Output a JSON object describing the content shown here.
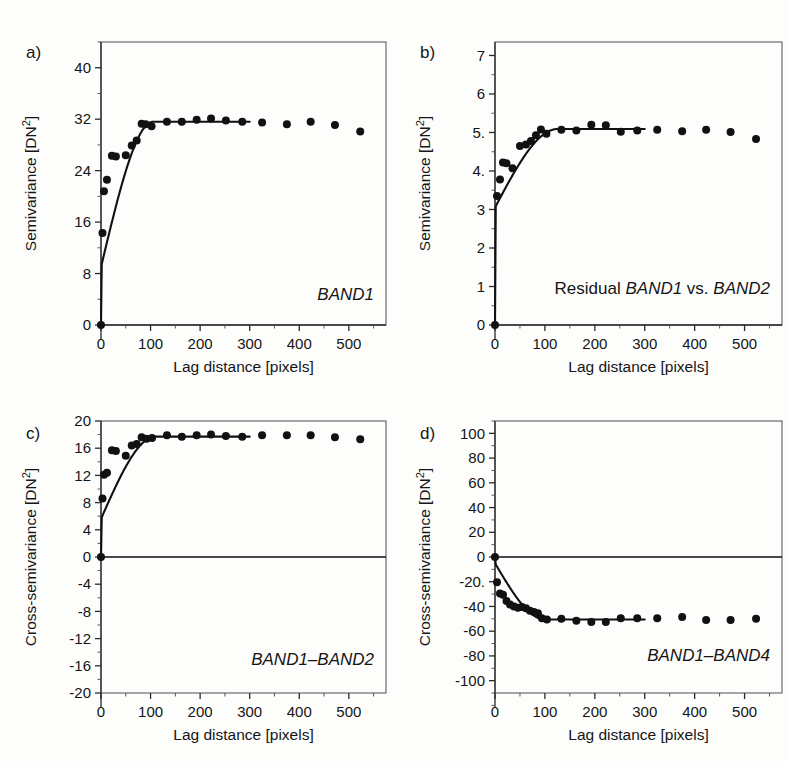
{
  "figure": {
    "background": "#fdfdfc",
    "point_color": "#111111",
    "curve_color": "#111111",
    "axis_color": "#2a2a2a"
  },
  "panels": [
    {
      "letter": "a)",
      "series_label": "BAND1",
      "series_label_prefix": "",
      "series_label_italic": true
    },
    {
      "letter": "b)",
      "series_label": "BAND1",
      "series_label_prefix": "Residual ",
      "series_label_mid": " vs. ",
      "series_label_suffix": "BAND2",
      "series_label_italic": true
    },
    {
      "letter": "c)",
      "series_label": "BAND1–BAND2",
      "series_label_italic": true
    },
    {
      "letter": "d)",
      "series_label": "BAND1–BAND4",
      "series_label_italic": true
    }
  ],
  "chart_data": [
    {
      "panel": "a",
      "type": "scatter",
      "title": "BAND1",
      "xlabel": "Lag distance [pixels]",
      "ylabel": "Semivariance [DN2]",
      "ylabel_display": "Semivariance [DN²]",
      "xlim": [
        0,
        575
      ],
      "ylim": [
        0,
        44
      ],
      "xticks": [
        0,
        100,
        200,
        300,
        400,
        500
      ],
      "xticklabels": [
        "0",
        "100",
        "200",
        "300",
        "400",
        "500"
      ],
      "xminor_step": 50,
      "yticks": [
        0,
        8,
        16,
        24,
        32,
        40
      ],
      "yticklabels": [
        "0",
        "8",
        "16",
        "24",
        "32",
        "40"
      ],
      "yminor_step": 4,
      "grid": false,
      "legend": "none",
      "zero_line": false,
      "x": [
        0,
        3,
        6,
        12,
        22,
        30,
        50,
        62,
        72,
        82,
        90,
        102,
        133,
        163,
        193,
        222,
        252,
        285,
        325,
        375,
        423,
        472,
        523
      ],
      "y": [
        0.0,
        14.3,
        20.8,
        22.6,
        26.3,
        26.2,
        26.4,
        27.9,
        28.7,
        31.3,
        31.2,
        30.9,
        31.6,
        31.6,
        31.9,
        32.1,
        31.8,
        31.6,
        31.5,
        31.2,
        31.6,
        31.1,
        30.1
      ],
      "model": {
        "type": "spherical",
        "nugget": 9.0,
        "sill": 31.6,
        "range": 105
      }
    },
    {
      "panel": "b",
      "type": "scatter",
      "title": "Residual BAND1 vs. BAND2",
      "xlabel": "Lag distance [pixels]",
      "ylabel": "Semivariance [DN2]",
      "ylabel_display": "Semivariance [DN²]",
      "xlim": [
        0,
        575
      ],
      "ylim": [
        0,
        7.35
      ],
      "xticks": [
        0,
        100,
        200,
        300,
        400,
        500
      ],
      "xticklabels": [
        "0",
        "100",
        "200",
        "300",
        "400",
        "500"
      ],
      "xminor_step": 50,
      "yticks": [
        0,
        1,
        2,
        3,
        4,
        5,
        6,
        7
      ],
      "yticklabels": [
        "0",
        "1",
        "2",
        "3",
        "4.",
        "5.",
        "6",
        "7"
      ],
      "yminor_step": 0.5,
      "grid": false,
      "legend": "none",
      "zero_line": false,
      "x": [
        0,
        4,
        10,
        16,
        23,
        35,
        50,
        62,
        72,
        82,
        92,
        103,
        133,
        163,
        193,
        222,
        252,
        285,
        325,
        375,
        423,
        472,
        523
      ],
      "y": [
        0.0,
        3.35,
        3.78,
        4.22,
        4.2,
        4.07,
        4.65,
        4.69,
        4.78,
        4.93,
        5.08,
        4.97,
        5.07,
        5.05,
        5.2,
        5.19,
        5.02,
        5.05,
        5.07,
        5.03,
        5.07,
        5.01,
        4.83
      ],
      "model": {
        "type": "spherical",
        "nugget": 3.05,
        "sill": 5.09,
        "range": 125
      }
    },
    {
      "panel": "c",
      "type": "scatter",
      "title": "BAND1–BAND2",
      "xlabel": "Lag distance [pixels]",
      "ylabel": "Cross-semivariance [DN2]",
      "ylabel_display": "Cross-semivariance [DN²]",
      "xlim": [
        0,
        575
      ],
      "ylim": [
        -20,
        20
      ],
      "xticks": [
        0,
        100,
        200,
        300,
        400,
        500
      ],
      "xticklabels": [
        "0",
        "100",
        "200",
        "300",
        "400",
        "500"
      ],
      "xminor_step": 50,
      "yticks": [
        -20,
        -16,
        -12,
        -8,
        -4,
        0,
        4,
        8,
        12,
        16,
        20
      ],
      "yticklabels": [
        "-20",
        "-16",
        "-12",
        "-8",
        "-4",
        "0",
        "4",
        "8",
        "12",
        "16",
        "20"
      ],
      "yminor_step": 2,
      "grid": false,
      "legend": "none",
      "zero_line": true,
      "x": [
        0,
        3,
        6,
        12,
        22,
        30,
        50,
        62,
        72,
        82,
        92,
        103,
        133,
        163,
        193,
        222,
        252,
        285,
        325,
        375,
        423,
        472,
        523
      ],
      "y": [
        0.0,
        8.6,
        12.1,
        12.4,
        15.7,
        15.6,
        14.9,
        16.4,
        16.6,
        17.6,
        17.4,
        17.5,
        17.9,
        17.7,
        17.9,
        18.0,
        17.8,
        17.7,
        17.9,
        17.9,
        17.9,
        17.6,
        17.3
      ],
      "model": {
        "type": "spherical",
        "nugget": 5.6,
        "sill": 17.7,
        "range": 110
      }
    },
    {
      "panel": "d",
      "type": "scatter",
      "title": "BAND1–BAND4",
      "xlabel": "Lag distance [pixels]",
      "ylabel": "Cross-semivariance [DN2]",
      "ylabel_display": "Cross-semivariance [DN²]",
      "xlim": [
        0,
        575
      ],
      "ylim": [
        -110,
        110
      ],
      "xticks": [
        0,
        100,
        200,
        300,
        400,
        500
      ],
      "xticklabels": [
        "0",
        "100",
        "200",
        "300",
        "400",
        "500"
      ],
      "xminor_step": 50,
      "yticks": [
        -100,
        -80,
        -60,
        -40,
        -20,
        0,
        20,
        40,
        60,
        80,
        100
      ],
      "yticklabels": [
        "-100",
        "-80",
        "-60",
        "-40",
        "-20.",
        "0",
        "20",
        "40",
        "60",
        "80",
        "100"
      ],
      "yminor_step": 10,
      "grid": false,
      "legend": "none",
      "zero_line": true,
      "x": [
        0,
        4,
        10,
        16,
        23,
        30,
        38,
        46,
        54,
        62,
        70,
        78,
        86,
        94,
        104,
        133,
        163,
        193,
        222,
        252,
        285,
        325,
        375,
        423,
        472,
        523
      ],
      "y": [
        0.0,
        -20.5,
        -29.5,
        -30.5,
        -35.5,
        -38.5,
        -40.0,
        -41.0,
        -40.5,
        -41.5,
        -43.5,
        -44.5,
        -45.5,
        -49.5,
        -50.5,
        -50.0,
        -51.5,
        -52.5,
        -52.5,
        -49.5,
        -49.5,
        -49.5,
        -48.5,
        -51.0,
        -51.0,
        -50.0
      ],
      "model": {
        "type": "spherical",
        "nugget": -5.0,
        "sill": -50.5,
        "range": 100
      }
    }
  ]
}
